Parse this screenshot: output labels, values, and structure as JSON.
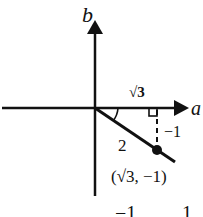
{
  "diagram": {
    "axes": {
      "horizontal_label": "a",
      "vertical_label": "b"
    },
    "labels": {
      "adjacent_side": "√3",
      "hypotenuse": "2",
      "opposite_side": "−1",
      "point": "(√3, −1)"
    },
    "bottom_labels": {
      "left": "−1",
      "right": "1"
    },
    "colors": {
      "ink": "#111111",
      "background": "#ffffff"
    }
  }
}
